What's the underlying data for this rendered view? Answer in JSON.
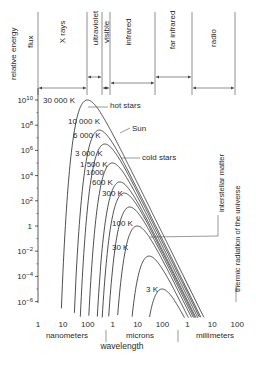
{
  "chart_data": {
    "type": "line",
    "ylabel": "relative energy flux",
    "xlabel": "wavelength",
    "x_scale": "log",
    "y_scale": "log",
    "y_ticks": [
      "10 10",
      "10 8",
      "10 6",
      "10 4",
      "10 2",
      "1",
      "10 -2",
      "10 -4",
      "10 -6"
    ],
    "y_tick_values": [
      10000000000.0,
      100000000.0,
      1000000.0,
      10000.0,
      100.0,
      1,
      0.01,
      0.0001,
      1e-06
    ],
    "x_ticks": [
      "1",
      "10",
      "100",
      "1",
      "10",
      "100",
      "1",
      "10",
      "100"
    ],
    "x_units": [
      {
        "label": "nanometers"
      },
      {
        "label": "microns"
      },
      {
        "label": "millimeters"
      }
    ],
    "bands": [
      {
        "label": "X rays"
      },
      {
        "label": "ultraviolet"
      },
      {
        "label": "visible"
      },
      {
        "label": "infrared"
      },
      {
        "label": "far infrared"
      },
      {
        "label": "radio"
      }
    ],
    "series": [
      {
        "name": "30 000 K",
        "peak_wavelength_nm": 100,
        "peak_flux": 10000000000.0
      },
      {
        "name": "10 000 K",
        "peak_wavelength_nm": 290,
        "peak_flux": 30000000.0
      },
      {
        "name": "6 000 K",
        "peak_wavelength_nm": 480,
        "peak_flux": 3000000.0
      },
      {
        "name": "3 000 K",
        "peak_wavelength_nm": 970,
        "peak_flux": 100000.0
      },
      {
        "name": "1 500 K",
        "peak_wavelength_nm": 1930,
        "peak_flux": 3000.0
      },
      {
        "name": "1000",
        "peak_wavelength_nm": 2900,
        "peak_flux": 400.0
      },
      {
        "name": "600 K",
        "peak_wavelength_nm": 4800,
        "peak_flux": 30.0
      },
      {
        "name": "300 K",
        "peak_wavelength_nm": 9700,
        "peak_flux": 1
      },
      {
        "name": "100 K",
        "peak_wavelength_nm": 29000,
        "peak_flux": 0.004
      },
      {
        "name": "30 K",
        "peak_wavelength_nm": 97000,
        "peak_flux": 1e-05
      },
      {
        "name": "3 K",
        "peak_wavelength_nm": 970000,
        "peak_flux": 1e-10
      }
    ],
    "annotations": [
      "hot stars",
      "Sun",
      "cold stars",
      "interstellar matter",
      "thermic radiation of the universe"
    ]
  },
  "labels": {
    "y_axis": "relative energy",
    "y_axis2": "flux",
    "x_axis": "wavelength",
    "hot_stars": "hot stars",
    "sun": "Sun",
    "cold_stars": "cold stars",
    "interstellar": "interstellar matter",
    "thermic": "thermic radiation of the universe"
  }
}
